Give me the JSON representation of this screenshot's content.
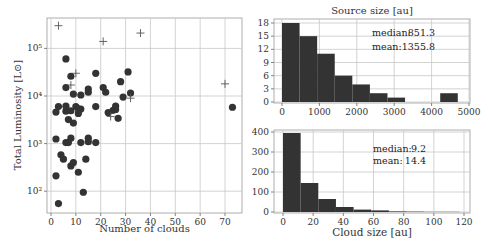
{
  "chart_data": [
    {
      "type": "scatter",
      "title": "",
      "xlabel": "Number of clouds",
      "ylabel": "Total Luminosity [L⊙]",
      "xlim": [
        -1,
        77
      ],
      "ylim_log10": [
        1.6,
        5.65
      ],
      "yscale": "log",
      "grid": true,
      "x_ticks": [
        0,
        10,
        20,
        30,
        40,
        50,
        60,
        70
      ],
      "y_ticks": [
        {
          "value": 100,
          "label": "10²"
        },
        {
          "value": 1000,
          "label": "10³"
        },
        {
          "value": 10000,
          "label": "10⁴"
        },
        {
          "value": 100000,
          "label": "10⁵"
        }
      ],
      "series": [
        {
          "name": "circles",
          "marker": "circle",
          "color": "#333333",
          "points": [
            [
              3,
              55
            ],
            [
              2,
              210
            ],
            [
              13,
              95
            ],
            [
              2,
              1250
            ],
            [
              4,
              580
            ],
            [
              5,
              470
            ],
            [
              8,
              340
            ],
            [
              9,
              400
            ],
            [
              11,
              250
            ],
            [
              14,
              470
            ],
            [
              6,
              1050
            ],
            [
              7,
              1050
            ],
            [
              8,
              1300
            ],
            [
              12,
              1050
            ],
            [
              15,
              1100
            ],
            [
              15,
              1300
            ],
            [
              18,
              1050
            ],
            [
              7,
              3200
            ],
            [
              9,
              2700
            ],
            [
              11,
              4300
            ],
            [
              12,
              5300
            ],
            [
              2,
              4600
            ],
            [
              3,
              6000
            ],
            [
              6,
              4800
            ],
            [
              6,
              6100
            ],
            [
              8,
              4900
            ],
            [
              10,
              6000
            ],
            [
              11,
              5400
            ],
            [
              18,
              6000
            ],
            [
              23,
              4500
            ],
            [
              25,
              5000
            ],
            [
              26,
              5200
            ],
            [
              26,
              6100
            ],
            [
              27,
              3400
            ],
            [
              6,
              15000
            ],
            [
              8,
              26000
            ],
            [
              9,
              11000
            ],
            [
              12,
              10500
            ],
            [
              15,
              12000
            ],
            [
              15,
              14000
            ],
            [
              18,
              30000
            ],
            [
              21,
              15000
            ],
            [
              22,
              12000
            ],
            [
              28,
              20000
            ],
            [
              29,
              9500
            ],
            [
              31,
              32000
            ],
            [
              32,
              11500
            ],
            [
              6,
              60000
            ],
            [
              73,
              5800
            ]
          ]
        },
        {
          "name": "crosses",
          "marker": "plus",
          "color": "#555555",
          "points": [
            [
              3,
              300000
            ],
            [
              21,
              140000
            ],
            [
              36,
              210000
            ],
            [
              10,
              30000
            ],
            [
              8,
              17000
            ],
            [
              70,
              18000
            ],
            [
              32,
              9000
            ],
            [
              24,
              3700
            ]
          ]
        }
      ]
    },
    {
      "type": "bar",
      "title": "Source size [au]",
      "xlabel": "",
      "ylabel": "",
      "xlim": [
        -200,
        5000
      ],
      "ylim": [
        0,
        19
      ],
      "grid": true,
      "x_ticks": [
        0,
        1000,
        2000,
        3000,
        4000,
        5000
      ],
      "y_ticks": [
        0,
        3,
        6,
        9,
        12,
        15,
        18
      ],
      "bin_edges": [
        0,
        470,
        940,
        1410,
        1880,
        2350,
        2820,
        3290,
        3760,
        4230,
        4700
      ],
      "values": [
        18,
        15,
        11,
        6,
        4,
        2,
        1,
        0,
        0,
        2
      ],
      "color": "#333333",
      "annotations": [
        {
          "label": "median:",
          "value": "851.3"
        },
        {
          "label": "mean:",
          "value": "1355.8"
        }
      ]
    },
    {
      "type": "bar",
      "title": "",
      "xlabel": "Cloud size [au]",
      "ylabel": "",
      "xlim": [
        -4,
        125
      ],
      "ylim": [
        0,
        410
      ],
      "grid": true,
      "x_ticks": [
        0,
        20,
        40,
        60,
        80,
        100,
        120
      ],
      "y_ticks": [
        0,
        100,
        200,
        300,
        400
      ],
      "bin_edges": [
        0,
        11.7,
        23.4,
        35.1,
        46.8,
        58.5,
        70.2,
        81.9,
        93.6,
        105.3,
        117
      ],
      "values": [
        395,
        145,
        65,
        25,
        12,
        8,
        3,
        2,
        1,
        1
      ],
      "color": "#333333",
      "annotations": [
        {
          "label": "median:",
          "value": "9.2"
        },
        {
          "label": "mean:",
          "value": "14.4"
        }
      ]
    }
  ]
}
